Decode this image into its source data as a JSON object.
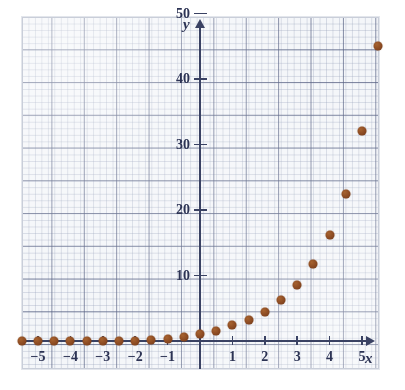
{
  "chart_data": {
    "type": "scatter",
    "title": "",
    "subtitle": "",
    "xlabel": "x",
    "ylabel": "y",
    "xlim": [
      -5.8,
      5.8
    ],
    "ylim": [
      -2.5,
      55
    ],
    "grid": true,
    "grid_major_x_step": 1,
    "grid_major_y_step": 5,
    "legend": "none",
    "xticks": [
      -5,
      -4,
      -3,
      -2,
      -1,
      1,
      2,
      3,
      4,
      5
    ],
    "xtick_labels": [
      "−5",
      "−4",
      "−3",
      "−2",
      "−1",
      "1",
      "2",
      "3",
      "4",
      "5"
    ],
    "yticks": [
      10,
      20,
      30,
      40,
      50
    ],
    "ytick_labels": [
      "10",
      "20",
      "30",
      "40",
      "50"
    ],
    "point_color": "#8b4a22",
    "axis_color": "#3a4263",
    "grid_major_color": "#566082",
    "grid_minor_color": "#96a0b9",
    "paper_color": "#f4f6f9",
    "series": [
      {
        "name": "data",
        "marker": "filled-circle",
        "x": [
          -5.5,
          -5.0,
          -4.5,
          -4.0,
          -3.5,
          -3.0,
          -2.5,
          -2.0,
          -1.5,
          -1.0,
          -0.5,
          0.0,
          0.5,
          1.0,
          1.5,
          2.0,
          2.5,
          3.0,
          3.5,
          4.0,
          4.5,
          5.0,
          5.5
        ],
        "y": [
          0.05,
          0.08,
          0.12,
          0.2,
          0.3,
          0.45,
          0.7,
          1.0,
          1.5,
          2.2,
          3.0,
          3.2,
          4.0,
          4.6,
          5.4,
          6.6,
          8.2,
          11.3,
          15.8,
          22.0,
          30.6,
          42.4,
          58.7
        ]
      }
    ],
    "points_plotted": [
      {
        "x": -5.5,
        "y": 0.0
      },
      {
        "x": -5.0,
        "y": 0.0
      },
      {
        "x": -4.5,
        "y": 0.0
      },
      {
        "x": -4.0,
        "y": 0.0
      },
      {
        "x": -3.5,
        "y": 0.0
      },
      {
        "x": -3.0,
        "y": 0.0
      },
      {
        "x": -2.5,
        "y": 0.0
      },
      {
        "x": -2.0,
        "y": 0.0
      },
      {
        "x": -1.5,
        "y": 0.1
      },
      {
        "x": -1.0,
        "y": 0.3
      },
      {
        "x": -0.5,
        "y": 0.6
      },
      {
        "x": 0.0,
        "y": 1.0
      },
      {
        "x": 0.5,
        "y": 1.6
      },
      {
        "x": 1.0,
        "y": 2.4
      },
      {
        "x": 1.5,
        "y": 3.2
      },
      {
        "x": 2.0,
        "y": 4.5
      },
      {
        "x": 2.5,
        "y": 6.3
      },
      {
        "x": 3.0,
        "y": 8.6
      },
      {
        "x": 3.5,
        "y": 11.8
      },
      {
        "x": 4.0,
        "y": 16.2
      },
      {
        "x": 4.5,
        "y": 22.5
      },
      {
        "x": 5.0,
        "y": 32.0
      },
      {
        "x": 5.5,
        "y": 45.0
      }
    ]
  }
}
